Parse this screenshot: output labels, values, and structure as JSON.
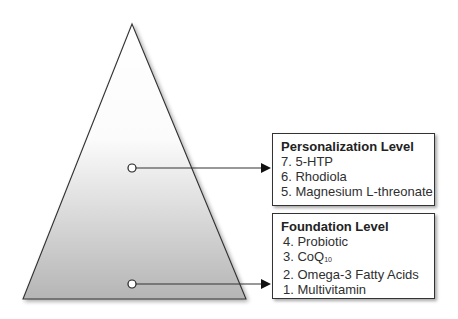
{
  "pyramid": {
    "fill_top": "#ffffff",
    "fill_bottom": "#b8b8b8",
    "stroke": "#333333"
  },
  "levels": [
    {
      "title": "Personalization Level",
      "items": [
        "7. 5-HTP",
        "6. Rhodiola",
        "5. Magnesium L-threonate"
      ]
    },
    {
      "title": "Foundation Level",
      "items": [
        "4. Probiotic",
        "3. CoQ",
        "2. Omega-3 Fatty Acids",
        "1. Multivitamin"
      ],
      "coq_subscript": "10"
    }
  ]
}
